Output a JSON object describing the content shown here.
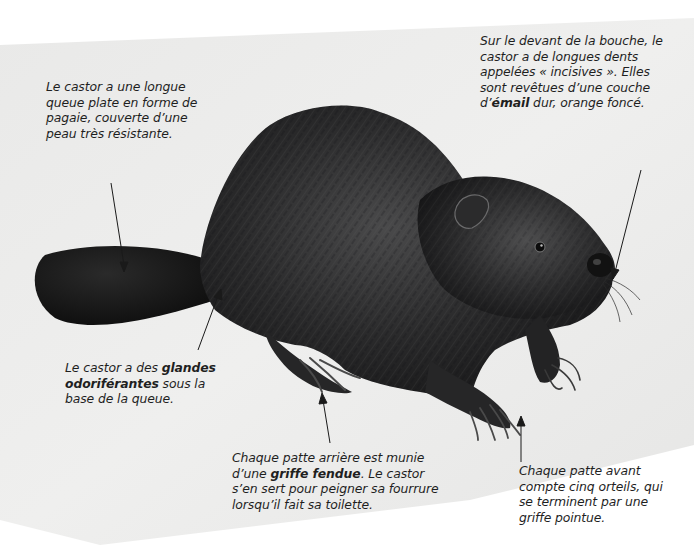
{
  "diagram": {
    "subject": "castor",
    "colors": {
      "background_panel": "#ececeb",
      "fur_dark": "#1b1b1c",
      "fur_mid": "#3a3a3b",
      "fur_light": "#6b6b6c",
      "tail": "#141414",
      "text": "#1f1f1f",
      "arrow": "#1a1a1a"
    },
    "annotations": {
      "tail": {
        "lines": [
          {
            "text": "Le castor a une longue"
          },
          {
            "text": "queue plate en forme de"
          },
          {
            "text": "pagaie, couverte d’une"
          },
          {
            "text": "peau très résistante."
          }
        ]
      },
      "incisors": {
        "line1": "Sur le devant de la bouche, le",
        "line2": "castor a de longues dents",
        "line3": "appelées « incisives ». Elles",
        "line4": "sont revêtues d’une couche",
        "line5_pre": "d’",
        "line5_bold": "émail",
        "line5_post": " dur, orange foncé."
      },
      "glands": {
        "line1_pre": "Le castor a des ",
        "line1_bold": "glandes",
        "line2_bold": "odoriférantes",
        "line2_post": " sous la",
        "line3": "base de la queue."
      },
      "hind_foot": {
        "line1": "Chaque patte arrière est munie",
        "line2_pre": "d’une ",
        "line2_bold": "griffe fendue",
        "line2_post": ". Le castor",
        "line3": "s’en sert pour peigner sa fourrure",
        "line4": "lorsqu’il fait sa toilette."
      },
      "front_foot": {
        "lines": [
          {
            "text": "Chaque patte avant"
          },
          {
            "text": "compte cinq orteils, qui"
          },
          {
            "text": "se terminent par une"
          },
          {
            "text": "griffe pointue."
          }
        ]
      }
    },
    "icons": [
      "beaver-illustration",
      "arrow-tail",
      "arrow-incisors",
      "arrow-glands",
      "arrow-hind-foot",
      "arrow-front-foot"
    ]
  }
}
